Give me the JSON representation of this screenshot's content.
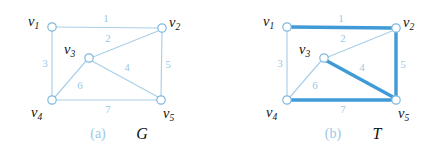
{
  "figure": {
    "width": 441,
    "height": 158,
    "background": "#ffffff",
    "colors": {
      "edge_thin": "#a8cfe8",
      "edge_thick": "#3f9ad6",
      "vertex_stroke": "#7fb8dd",
      "vertex_fill": "#ffffff",
      "edge_label": "#9cc8e6",
      "caption_tag": "#9cc8e6",
      "caption_name": "#111111",
      "vertex_label": "#111111"
    }
  },
  "panels": [
    {
      "id": "panel-a",
      "caption_tag": "(a)",
      "caption_name": "G",
      "caption_tag_x": 98,
      "caption_tag_y": 138,
      "caption_name_x": 142,
      "caption_name_y": 139,
      "vertices": [
        {
          "id": "v1",
          "base": "v",
          "sub": "1",
          "cx": 52,
          "cy": 27,
          "r": 4.2,
          "label_x": 28,
          "label_y": 26
        },
        {
          "id": "v2",
          "base": "v",
          "sub": "2",
          "cx": 162,
          "cy": 28,
          "r": 4.2,
          "label_x": 169,
          "label_y": 27
        },
        {
          "id": "v3",
          "base": "v",
          "sub": "3",
          "cx": 89,
          "cy": 58,
          "r": 4.2,
          "label_x": 64,
          "label_y": 54
        },
        {
          "id": "v4",
          "base": "v",
          "sub": "4",
          "cx": 52,
          "cy": 100,
          "r": 4.2,
          "label_x": 31,
          "label_y": 117
        },
        {
          "id": "v5",
          "base": "v",
          "sub": "5",
          "cx": 161,
          "cy": 100,
          "r": 4.2,
          "label_x": 163,
          "label_y": 118
        }
      ],
      "edges": [
        {
          "id": "a-e1",
          "weight": "1",
          "from": "v1",
          "to": "v2",
          "x1": 56,
          "y1": 27,
          "x2": 158,
          "y2": 28,
          "highlighted": false,
          "label_x": 106,
          "label_y": 22
        },
        {
          "id": "a-e2",
          "weight": "2",
          "from": "v3",
          "to": "v2",
          "x1": 93,
          "y1": 57,
          "x2": 158,
          "y2": 31,
          "highlighted": false,
          "label_x": 108,
          "label_y": 42
        },
        {
          "id": "a-e3",
          "weight": "3",
          "from": "v1",
          "to": "v4",
          "x1": 52,
          "y1": 31,
          "x2": 52,
          "y2": 96,
          "highlighted": false,
          "label_x": 45,
          "label_y": 67
        },
        {
          "id": "a-e4",
          "weight": "4",
          "from": "v3",
          "to": "v5",
          "x1": 92,
          "y1": 61,
          "x2": 158,
          "y2": 97,
          "highlighted": false,
          "label_x": 127,
          "label_y": 71
        },
        {
          "id": "a-e5",
          "weight": "5",
          "from": "v2",
          "to": "v5",
          "x1": 162,
          "y1": 32,
          "x2": 161,
          "y2": 96,
          "highlighted": false,
          "label_x": 168,
          "label_y": 68
        },
        {
          "id": "a-e6",
          "weight": "6",
          "from": "v4",
          "to": "v3",
          "x1": 55,
          "y1": 97,
          "x2": 86,
          "y2": 61,
          "highlighted": false,
          "label_x": 80,
          "label_y": 89
        },
        {
          "id": "a-e7",
          "weight": "7",
          "from": "v4",
          "to": "v5",
          "x1": 56,
          "y1": 100,
          "x2": 157,
          "y2": 100,
          "highlighted": false,
          "label_x": 108,
          "label_y": 113
        }
      ]
    },
    {
      "id": "panel-b",
      "caption_tag": "(b)",
      "caption_name": "T",
      "caption_tag_x": 333,
      "caption_tag_y": 138,
      "caption_name_x": 377,
      "caption_name_y": 139,
      "vertices": [
        {
          "id": "v1",
          "base": "v",
          "sub": "1",
          "cx": 287,
          "cy": 27,
          "r": 4.2,
          "label_x": 263,
          "label_y": 26
        },
        {
          "id": "v2",
          "base": "v",
          "sub": "2",
          "cx": 396,
          "cy": 28,
          "r": 4.2,
          "label_x": 403,
          "label_y": 27
        },
        {
          "id": "v3",
          "base": "v",
          "sub": "3",
          "cx": 324,
          "cy": 58,
          "r": 4.2,
          "label_x": 299,
          "label_y": 54
        },
        {
          "id": "v4",
          "base": "v",
          "sub": "4",
          "cx": 287,
          "cy": 100,
          "r": 4.2,
          "label_x": 266,
          "label_y": 117
        },
        {
          "id": "v5",
          "base": "v",
          "sub": "5",
          "cx": 396,
          "cy": 100,
          "r": 4.2,
          "label_x": 398,
          "label_y": 118
        }
      ],
      "edges": [
        {
          "id": "b-e1",
          "weight": "1",
          "from": "v1",
          "to": "v2",
          "x1": 291,
          "y1": 27,
          "x2": 392,
          "y2": 28,
          "highlighted": true,
          "label_x": 341,
          "label_y": 22
        },
        {
          "id": "b-e2",
          "weight": "2",
          "from": "v3",
          "to": "v2",
          "x1": 328,
          "y1": 57,
          "x2": 392,
          "y2": 31,
          "highlighted": false,
          "label_x": 343,
          "label_y": 42
        },
        {
          "id": "b-e3",
          "weight": "3",
          "from": "v1",
          "to": "v4",
          "x1": 287,
          "y1": 31,
          "x2": 287,
          "y2": 96,
          "highlighted": false,
          "label_x": 280,
          "label_y": 67
        },
        {
          "id": "b-e4",
          "weight": "4",
          "from": "v3",
          "to": "v5",
          "x1": 327,
          "y1": 61,
          "x2": 393,
          "y2": 97,
          "highlighted": true,
          "label_x": 362,
          "label_y": 71
        },
        {
          "id": "b-e5",
          "weight": "5",
          "from": "v2",
          "to": "v5",
          "x1": 396,
          "y1": 32,
          "x2": 396,
          "y2": 96,
          "highlighted": true,
          "label_x": 403,
          "label_y": 68
        },
        {
          "id": "b-e6",
          "weight": "6",
          "from": "v4",
          "to": "v3",
          "x1": 290,
          "y1": 97,
          "x2": 321,
          "y2": 61,
          "highlighted": false,
          "label_x": 315,
          "label_y": 89
        },
        {
          "id": "b-e7",
          "weight": "7",
          "from": "v4",
          "to": "v5",
          "x1": 291,
          "y1": 100,
          "x2": 392,
          "y2": 100,
          "highlighted": true,
          "label_x": 343,
          "label_y": 113
        }
      ]
    }
  ],
  "chart_data": {
    "type": "diagram",
    "subfigures": [
      {
        "label": "(a)",
        "name": "G",
        "description": "Weighted undirected graph on five vertices",
        "nodes": [
          "v1",
          "v2",
          "v3",
          "v4",
          "v5"
        ],
        "edges": [
          {
            "weight": 1,
            "endpoints": [
              "v1",
              "v2"
            ],
            "in_tree": false
          },
          {
            "weight": 2,
            "endpoints": [
              "v3",
              "v2"
            ],
            "in_tree": false
          },
          {
            "weight": 3,
            "endpoints": [
              "v1",
              "v4"
            ],
            "in_tree": false
          },
          {
            "weight": 4,
            "endpoints": [
              "v3",
              "v5"
            ],
            "in_tree": false
          },
          {
            "weight": 5,
            "endpoints": [
              "v2",
              "v5"
            ],
            "in_tree": false
          },
          {
            "weight": 6,
            "endpoints": [
              "v4",
              "v3"
            ],
            "in_tree": false
          },
          {
            "weight": 7,
            "endpoints": [
              "v4",
              "v5"
            ],
            "in_tree": false
          }
        ]
      },
      {
        "label": "(b)",
        "name": "T",
        "description": "Spanning tree T of G highlighted in bold blue",
        "nodes": [
          "v1",
          "v2",
          "v3",
          "v4",
          "v5"
        ],
        "edges": [
          {
            "weight": 1,
            "endpoints": [
              "v1",
              "v2"
            ],
            "in_tree": true
          },
          {
            "weight": 2,
            "endpoints": [
              "v3",
              "v2"
            ],
            "in_tree": false
          },
          {
            "weight": 3,
            "endpoints": [
              "v1",
              "v4"
            ],
            "in_tree": false
          },
          {
            "weight": 4,
            "endpoints": [
              "v3",
              "v5"
            ],
            "in_tree": true
          },
          {
            "weight": 5,
            "endpoints": [
              "v2",
              "v5"
            ],
            "in_tree": true
          },
          {
            "weight": 6,
            "endpoints": [
              "v4",
              "v3"
            ],
            "in_tree": false
          },
          {
            "weight": 7,
            "endpoints": [
              "v4",
              "v5"
            ],
            "in_tree": true
          }
        ],
        "tree_edge_weights": [
          1,
          4,
          5,
          7
        ],
        "tree_total_weight": 17
      }
    ]
  }
}
